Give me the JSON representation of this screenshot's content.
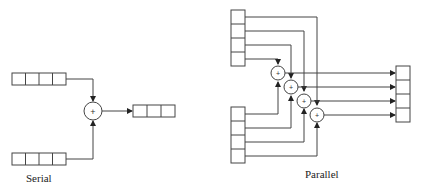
{
  "labels": {
    "serial": "Serial",
    "parallel": "Parallel"
  },
  "adder_symbol": "+",
  "colors": {
    "stroke": "#444444",
    "background": "#ffffff",
    "text": "#222222"
  },
  "serial": {
    "input_registers": 2,
    "cells_per_register": 4,
    "adders": 1,
    "output_cells_visible": 3
  },
  "parallel": {
    "input_registers": 2,
    "cells_per_register": 4,
    "adders": 4,
    "output_cells": 4
  }
}
